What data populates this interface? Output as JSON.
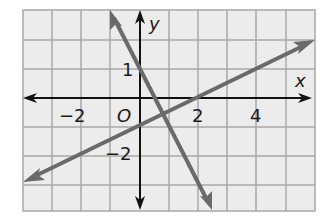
{
  "chart_data": {
    "type": "line",
    "title": "",
    "xlabel": "x",
    "ylabel": "y",
    "origin_label": "O",
    "xlim": [
      -4,
      6
    ],
    "ylim": [
      -4,
      3
    ],
    "x_ticks": [
      {
        "value": -2,
        "label": "−2"
      },
      {
        "value": 2,
        "label": "2"
      },
      {
        "value": 4,
        "label": "4"
      }
    ],
    "y_ticks": [
      {
        "value": 1,
        "label": "1"
      },
      {
        "value": -2,
        "label": "−2"
      }
    ],
    "grid": true,
    "series": [
      {
        "name": "line-1",
        "equation": "y = -2x + 1",
        "slope": -2,
        "intercept": 1,
        "arrows": "both"
      },
      {
        "name": "line-2",
        "equation": "y = 0.5x - 1",
        "slope": 0.5,
        "intercept": -1,
        "arrows": "both"
      }
    ],
    "intersection": {
      "x": 0.8,
      "y": -0.6
    }
  },
  "colors": {
    "grid_fill": "#ececec",
    "grid_line": "#a8a8a8",
    "axis": "#111111",
    "line": "#6a6a6a"
  }
}
